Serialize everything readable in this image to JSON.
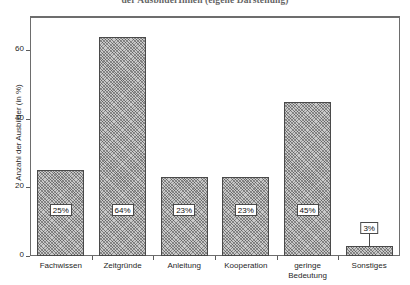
{
  "figure": {
    "caption_clipped": "der AusbilderInnen (eigene Darstellung)"
  },
  "chart_data": {
    "type": "bar",
    "title": "",
    "xlabel": "",
    "ylabel": "Anzahl der Ausbilder (in %)",
    "ylim": [
      0,
      70
    ],
    "yticks": [
      0,
      20,
      40,
      60
    ],
    "ytick_labels": [
      "0",
      "20",
      "40",
      "60"
    ],
    "grid": false,
    "legend": "none",
    "categories": [
      "Fachwissen",
      "Zeitgründe",
      "Anleitung",
      "Kooperation",
      "geringe Bedeutung",
      "Sonstiges"
    ],
    "category_lines": [
      [
        "Fachwissen"
      ],
      [
        "Zeitgründe"
      ],
      [
        "Anleitung"
      ],
      [
        "Kooperation"
      ],
      [
        "geringe",
        "Bedeutung"
      ],
      [
        "Sonstiges"
      ]
    ],
    "values": [
      25,
      64,
      23,
      23,
      45,
      3
    ],
    "data_labels": [
      "25%",
      "64%",
      "23%",
      "23%",
      "45%",
      "3%"
    ],
    "bar_style": {
      "fill": "#c9c9c9",
      "hatch": "crosshatch",
      "edge_color": "#4a4a4a"
    }
  },
  "axis": {
    "frame_color": "#6d6d6d",
    "tick_color": "#5c5c5c"
  }
}
